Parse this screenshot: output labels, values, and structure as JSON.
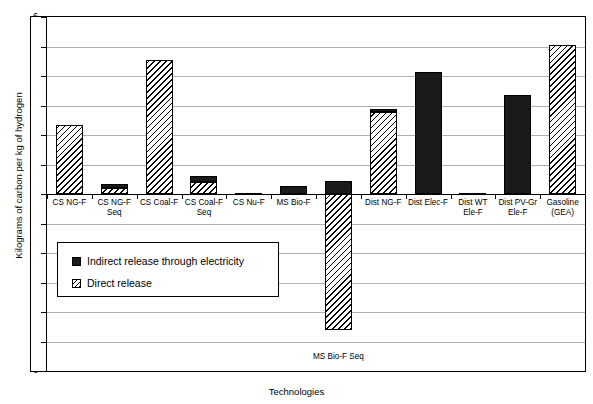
{
  "chart_data": {
    "type": "bar",
    "title": "",
    "xlabel": "Technologies",
    "ylabel": "Kilograms of carbon per kg of hydrogen",
    "ylim": [
      -6,
      6
    ],
    "ytick_labels": [
      "6",
      "5",
      "4",
      "3",
      "2",
      "1",
      "0",
      "-1",
      "-2",
      "-3",
      "-4",
      "-5",
      "-6"
    ],
    "ytick_values": [
      6,
      5,
      4,
      3,
      2,
      1,
      0,
      -1,
      -2,
      -3,
      -4,
      -5,
      -6
    ],
    "grid": true,
    "legend_position": "inside-lower-left",
    "stacked": true,
    "categories": [
      "CS NG-F",
      "CS NG-F Seq",
      "CS Coal-F",
      "CS Coal-F Seq",
      "CS Nu-F",
      "MS Bio-F",
      "MS Bio-F Seq",
      "Dist NG-F",
      "Dist Elec-F",
      "Dist WT Ele-F",
      "Dist PV-Gr Ele-F",
      "Gasoline (GEA)"
    ],
    "category_label_lines": [
      [
        "CS NG-F"
      ],
      [
        "CS NG-F",
        "Seq"
      ],
      [
        "CS Coal-F"
      ],
      [
        "CS Coal-F",
        "Seq"
      ],
      [
        "CS Nu-F"
      ],
      [
        "MS Bio-F"
      ],
      [
        ""
      ],
      [
        "Dist NG-F"
      ],
      [
        "Dist Elec-F"
      ],
      [
        "Dist WT",
        "Ele-F"
      ],
      [
        "Dist PV-Gr",
        "Ele-F"
      ],
      [
        "Gasoline",
        "(GEA)"
      ]
    ],
    "below_axis_labels": [
      {
        "category": "MS Bio-F Seq",
        "text": "MS Bio-F Seq"
      }
    ],
    "series": [
      {
        "name": "Direct release",
        "pattern": "diagonal-hatch",
        "color": "#ffffff",
        "values": [
          2.35,
          0.22,
          4.55,
          0.42,
          0.0,
          0.0,
          -4.6,
          2.78,
          0.0,
          0.0,
          0.0,
          5.05
        ]
      },
      {
        "name": "Indirect release through electricity",
        "pattern": "solid",
        "color": "#1a1a1a",
        "values": [
          0.0,
          0.13,
          0.0,
          0.18,
          0.04,
          0.28,
          0.45,
          0.1,
          4.15,
          0.05,
          3.35,
          0.0
        ]
      }
    ],
    "totals_positive": [
      2.35,
      0.35,
      4.55,
      0.6,
      0.04,
      0.28,
      0.45,
      2.88,
      4.15,
      0.05,
      3.35,
      5.05
    ],
    "annotations": []
  },
  "legend": {
    "items": [
      {
        "label": "Indirect release through electricity",
        "swatch": "solid-black"
      },
      {
        "label": "Direct release",
        "swatch": "hatched"
      }
    ]
  },
  "colors": {
    "indirect": "#1a1a1a",
    "direct_fill": "#ffffff",
    "hatch_line": "#000000",
    "gridline": "#b0b0b0",
    "axis": "#000000"
  }
}
